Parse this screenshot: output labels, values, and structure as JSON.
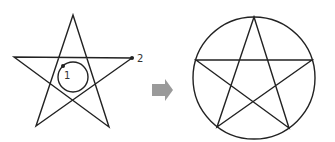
{
  "diagram": {
    "left_figure": {
      "type": "pentagram-with-inner-circle",
      "points": [
        {
          "label": "1"
        },
        {
          "label": "2"
        }
      ]
    },
    "arrow": {
      "direction": "right",
      "color": "#9a9a9a"
    },
    "right_figure": {
      "type": "pentagram-inscribed-in-circle"
    },
    "colors": {
      "stroke": "#222222",
      "arrow": "#9a9a9a",
      "background": "#ffffff"
    }
  }
}
